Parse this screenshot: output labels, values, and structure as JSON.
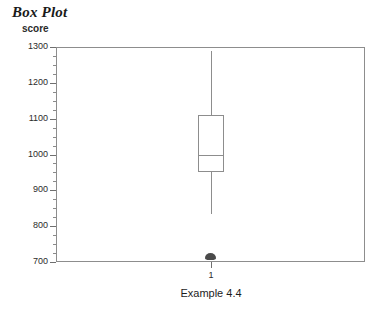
{
  "title": "Box Plot",
  "y_axis_title": "score",
  "x_axis_caption": "Example 4.4",
  "x_tick_label": "1",
  "colors": {
    "frame": "#8d8d8d",
    "box_stroke": "#8d8d8d",
    "outlier": "#4a4a4a",
    "text": "#1d1d1d",
    "tick": "#6f6f6f",
    "background": "#ffffff"
  },
  "chart_data": {
    "type": "box",
    "title": "Box Plot",
    "subtitle": "",
    "xlabel": "Example 4.4",
    "ylabel": "score",
    "ylim": [
      700,
      1300
    ],
    "y_major_step": 100,
    "y_minor_step": 25,
    "grid": false,
    "legend": null,
    "categories": [
      "1"
    ],
    "y_tick_labels": [
      "1300",
      "1200",
      "1100",
      "1000",
      "900",
      "800",
      "700"
    ],
    "y_tick_values": [
      1300,
      1200,
      1100,
      1000,
      900,
      800,
      700
    ],
    "y_minor_values": [
      1275,
      1250,
      1225,
      1175,
      1150,
      1125,
      1075,
      1050,
      1025,
      975,
      950,
      925,
      875,
      850,
      825,
      775,
      750,
      725
    ],
    "boxes": [
      {
        "category": "1",
        "whisker_low": 835,
        "q1": 950,
        "median": 1000,
        "q3": 1110,
        "whisker_high": 1290,
        "outliers": [
          705
        ]
      }
    ]
  }
}
